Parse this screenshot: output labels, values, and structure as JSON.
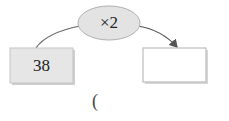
{
  "diagram": {
    "operator": "×2",
    "input_value": "38",
    "output_value": "",
    "answer_paren": "(",
    "colors": {
      "ellipse_fill": "#e3e3e3",
      "ellipse_stroke": "#aaaaaa",
      "input_box_fill": "#e6e6e6",
      "output_box_fill": "#ffffff",
      "box_stroke": "#bdbdbd",
      "arrow": "#555555"
    }
  }
}
